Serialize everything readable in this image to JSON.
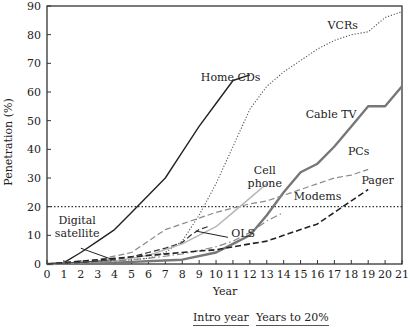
{
  "chart_data": {
    "type": "line",
    "title": "",
    "xlabel": "Year",
    "ylabel": "Penetration (%)",
    "xlim": [
      0,
      21
    ],
    "ylim": [
      0,
      90
    ],
    "xticks": [
      0,
      1,
      2,
      3,
      4,
      5,
      6,
      7,
      8,
      9,
      10,
      11,
      12,
      13,
      14,
      15,
      16,
      17,
      18,
      19,
      20,
      21
    ],
    "yticks": [
      0,
      10,
      20,
      30,
      40,
      50,
      60,
      70,
      80,
      90
    ],
    "reference_line": {
      "y": 20,
      "style": "dotted",
      "label": "20% threshold"
    },
    "series": [
      {
        "name": "Home CDs",
        "style": "solid",
        "color": "#222222",
        "width": 1.4,
        "x": [
          0,
          1,
          2,
          3,
          4,
          5,
          6,
          7,
          8,
          9,
          10,
          11,
          12
        ],
        "y": [
          0,
          0.5,
          4,
          8,
          12,
          18,
          24,
          30,
          39,
          48,
          56,
          64,
          66
        ],
        "label_pos": [
          9.1,
          64
        ]
      },
      {
        "name": "VCRs",
        "style": "dotted",
        "color": "#555555",
        "width": 1.1,
        "x": [
          0,
          2,
          4,
          6,
          7,
          8,
          9,
          10,
          11,
          12,
          13,
          14,
          15,
          16,
          17,
          18,
          19,
          20,
          21
        ],
        "y": [
          0,
          0.5,
          1,
          2,
          4,
          8,
          17,
          28,
          41,
          54,
          62,
          67,
          71,
          75,
          78,
          80,
          81,
          86,
          88
        ],
        "label_pos": [
          16.6,
          82
        ]
      },
      {
        "name": "Cable TV",
        "style": "solid",
        "color": "#777777",
        "width": 2.4,
        "x": [
          0,
          4,
          8,
          10,
          11,
          12,
          13,
          14,
          15,
          16,
          17,
          18,
          19,
          20,
          21
        ],
        "y": [
          0,
          0.5,
          1.5,
          4,
          7,
          10,
          17,
          25,
          32,
          35,
          41,
          48,
          55,
          55,
          62
        ],
        "label_pos": [
          15.3,
          51
        ]
      },
      {
        "name": "PCs",
        "style": "dashed",
        "color": "#888888",
        "width": 1.2,
        "x": [
          0,
          3,
          5,
          6,
          7,
          8,
          9,
          10,
          11,
          12,
          13,
          14,
          15,
          16,
          17,
          18,
          19
        ],
        "y": [
          0,
          1.5,
          4,
          8,
          12,
          14,
          16,
          18,
          19.5,
          21,
          22,
          24,
          26,
          28,
          30,
          31,
          33
        ],
        "label_pos": [
          17.8,
          38
        ]
      },
      {
        "name": "Cell phone",
        "style": "solid",
        "color": "#b5b5b5",
        "width": 1.4,
        "x": [
          0,
          4,
          6,
          8,
          10,
          11,
          12,
          13
        ],
        "y": [
          0,
          1,
          3,
          7,
          13,
          18,
          23,
          28
        ],
        "label_pos": [
          11.7,
          31.5
        ]
      },
      {
        "name": "Modems",
        "style": "dash-dot",
        "color": "#888888",
        "width": 1.2,
        "x": [
          0,
          4,
          6,
          8,
          10,
          11,
          12,
          13,
          14
        ],
        "y": [
          0,
          1,
          2,
          3.5,
          6,
          8,
          11,
          15,
          18
        ],
        "label_pos": [
          14.6,
          22.5
        ]
      },
      {
        "name": "Pager",
        "style": "dashed",
        "color": "#222222",
        "width": 1.6,
        "x": [
          0,
          2,
          4,
          6,
          8,
          10,
          12,
          13,
          14,
          15,
          16,
          17,
          18,
          19
        ],
        "y": [
          0,
          1,
          2,
          3,
          4,
          5,
          7,
          8,
          10,
          12,
          14,
          18,
          22,
          26
        ],
        "label_pos": [
          18.6,
          28
        ]
      },
      {
        "name": "OLS",
        "style": "dashed",
        "color": "#333333",
        "width": 1.2,
        "x": [
          0,
          2,
          4,
          5,
          6,
          7,
          8,
          8.5,
          9,
          9.5
        ],
        "y": [
          0,
          0.5,
          1.5,
          2.5,
          4,
          5.5,
          7.5,
          10,
          12,
          13
        ],
        "label_pos": [
          10.9,
          9.5
        ]
      },
      {
        "name": "Digital satellite",
        "style": "solid",
        "color": "#444444",
        "width": 1,
        "x": [
          0,
          1,
          2,
          3,
          4
        ],
        "y": [
          0,
          0.3,
          0.6,
          1,
          1.6
        ],
        "label_pos": [
          0.6,
          14
        ]
      }
    ],
    "annotations": [
      {
        "text": "Digital satellite",
        "pointer_from": [
          2.0,
          5.5
        ],
        "pointer_to": [
          3.9,
          1.5
        ]
      },
      {
        "text": "OLS",
        "pointer_from": [
          10.7,
          9.3
        ],
        "pointer_to": [
          8.8,
          11.5
        ]
      }
    ]
  },
  "axes": {
    "xlabel": "Year",
    "ylabel": "Penetration (%)"
  },
  "footer": {
    "intro_year": "Intro year",
    "years_to_20": "Years to 20%"
  }
}
